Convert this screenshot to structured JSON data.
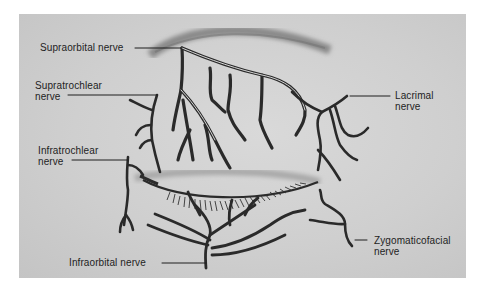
{
  "figure": {
    "background_color": "#cfcfcf",
    "line_color": "#2a2a2a"
  },
  "labels": {
    "supraorbital": {
      "line1": "Supraorbital nerve"
    },
    "supratrochlear": {
      "line1": "Supratrochlear",
      "line2": "nerve"
    },
    "infratrochlear": {
      "line1": "Infratrochlear",
      "line2": "nerve"
    },
    "infraorbital": {
      "line1": "Infraorbital nerve"
    },
    "lacrimal": {
      "line1": "Lacrimal",
      "line2": "nerve"
    },
    "zygomaticofacial": {
      "line1": "Zygomaticofacial",
      "line2": "nerve"
    }
  }
}
